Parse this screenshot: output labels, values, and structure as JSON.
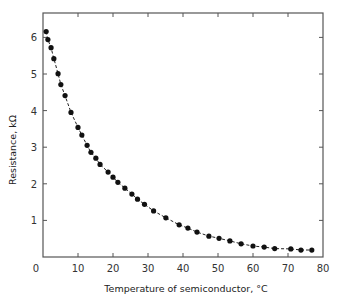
{
  "chart_data": {
    "type": "line",
    "title": "",
    "xlabel": "Temperature of semiconductor, °C",
    "ylabel": "Resistance, kΩ",
    "xlim": [
      0,
      80
    ],
    "ylim": [
      0,
      6.5
    ],
    "xticks": [
      0,
      10,
      20,
      30,
      40,
      50,
      60,
      70,
      80
    ],
    "yticks": [
      1,
      2,
      3,
      4,
      5,
      6
    ],
    "grid": false,
    "legend": null,
    "marker": "filled-circle",
    "line_style": "dashed",
    "series": [
      {
        "name": "Resistance",
        "x": [
          0.9,
          1.4,
          2.3,
          3.1,
          4.3,
          5.1,
          6.3,
          8.0,
          10.0,
          11.1,
          12.6,
          13.7,
          15.1,
          16.3,
          18.6,
          20.0,
          21.4,
          23.4,
          25.4,
          27.0,
          29.0,
          31.6,
          35.1,
          38.9,
          41.4,
          44.0,
          47.4,
          50.3,
          53.4,
          56.6,
          60.0,
          63.2,
          66.2,
          70.8,
          73.7,
          76.8
        ],
        "y": [
          6.16,
          5.94,
          5.72,
          5.42,
          5.01,
          4.71,
          4.41,
          3.95,
          3.54,
          3.33,
          3.05,
          2.86,
          2.7,
          2.53,
          2.32,
          2.18,
          2.04,
          1.88,
          1.72,
          1.58,
          1.44,
          1.26,
          1.07,
          0.88,
          0.79,
          0.68,
          0.57,
          0.51,
          0.44,
          0.36,
          0.3,
          0.27,
          0.23,
          0.22,
          0.19,
          0.19
        ]
      }
    ]
  },
  "labels": {
    "xlabel": "Temperature of semiconductor, °C",
    "ylabel": "Resistance, kΩ"
  },
  "colors": {
    "axis": "#555555",
    "marker": "#111111",
    "line": "#222222"
  }
}
